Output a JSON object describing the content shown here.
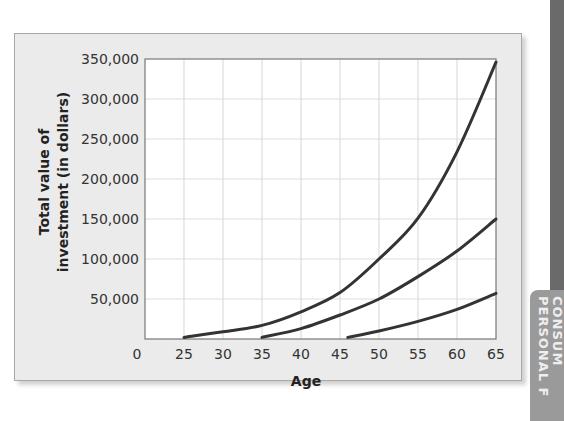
{
  "chart_data": {
    "type": "line",
    "title": "",
    "xlabel": "Age",
    "ylabel": "Total value of investment (in dollars)",
    "ylabel_lines": [
      "Total value of",
      "investment (in dollars)"
    ],
    "x_ticks": [
      "0",
      "25",
      "30",
      "35",
      "40",
      "45",
      "50",
      "55",
      "60",
      "65"
    ],
    "y_ticks": [
      "50,000",
      "100,000",
      "150,000",
      "200,000",
      "250,000",
      "300,000",
      "350,000"
    ],
    "xlim": [
      20,
      65
    ],
    "ylim": [
      0,
      350000
    ],
    "x_axis_break": "axis origin labeled 0, scale begins at 25",
    "grid": true,
    "legend": null,
    "series": [
      {
        "name": "Start at 25",
        "x": [
          25,
          30,
          35,
          40,
          45,
          50,
          55,
          60,
          65
        ],
        "values": [
          2000,
          9000,
          17000,
          34000,
          58000,
          100000,
          151000,
          234000,
          346000
        ]
      },
      {
        "name": "Start at 35",
        "x": [
          35,
          40,
          45,
          50,
          55,
          60,
          65
        ],
        "values": [
          2000,
          13000,
          30000,
          50000,
          78000,
          110000,
          150000
        ]
      },
      {
        "name": "Start at 46",
        "x": [
          46,
          50,
          55,
          60,
          65
        ],
        "values": [
          2000,
          10000,
          22000,
          37000,
          57000
        ]
      }
    ]
  },
  "side_tab": {
    "line1": "CONSUM",
    "line2": "PERSONAL F"
  },
  "colors": {
    "frame_bg": "#ebebeb",
    "plot_bg": "#ffffff",
    "curve": "#333333",
    "grid": "#dddddd",
    "side_dark": "#6a6a6a",
    "side_tab": "#9a9a9a"
  }
}
